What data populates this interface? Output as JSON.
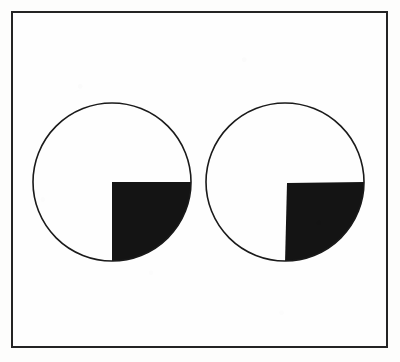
{
  "figure": {
    "canvas": {
      "width": 400,
      "height": 362,
      "background_color": "#fdfdfc"
    },
    "frame": {
      "x": 11,
      "y": 11,
      "width": 377,
      "height": 337,
      "stroke_color": "#242424",
      "stroke_width": 2,
      "fill_color": "#fefefe"
    },
    "colors": {
      "ink": "#141414",
      "outline": "#1a1a1a",
      "paper": "#fefefe",
      "frame": "#242424"
    },
    "shapes": [
      {
        "id": "left-circle",
        "label": "Left circle",
        "center_x": 112,
        "center_y": 182,
        "radius": 79,
        "outline_color": "#1a1a1a",
        "outline_width": 1.6,
        "fill_color": "#fefefe",
        "sector": {
          "label": "Left black quarter sector",
          "quadrant": "lower-right",
          "start_angle_deg": 0,
          "end_angle_deg": 90,
          "apex_x": 112,
          "apex_y": 182,
          "fill_color": "#141414",
          "sweep_fraction": 0.25
        }
      },
      {
        "id": "right-circle",
        "label": "Right circle",
        "center_x": 285,
        "center_y": 182,
        "radius": 79,
        "outline_color": "#1a1a1a",
        "outline_width": 1.6,
        "fill_color": "#fefefe",
        "sector": {
          "label": "Right black quarter sector (apex shifted right of centre)",
          "quadrant": "lower-right",
          "start_angle_deg": 0,
          "end_angle_deg": 90,
          "apex_x": 287,
          "apex_y": 183,
          "fill_color": "#141414",
          "sweep_fraction": 0.25
        }
      }
    ]
  }
}
